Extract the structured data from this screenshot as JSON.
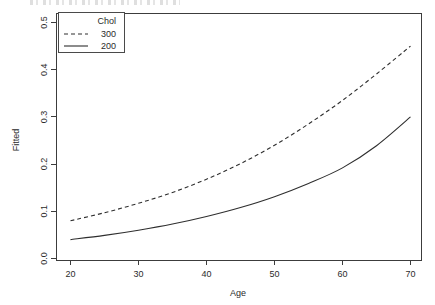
{
  "chart_data": {
    "type": "line",
    "title": "",
    "xlabel": "Age",
    "ylabel": "Fitted",
    "xlim": [
      20,
      70
    ],
    "ylim": [
      0.0,
      0.5
    ],
    "xticks": [
      20,
      30,
      40,
      50,
      60,
      70
    ],
    "xtick_labels": [
      "20",
      "30",
      "40",
      "50",
      "60",
      "70"
    ],
    "yticks": [
      0.0,
      0.1,
      0.2,
      0.3,
      0.4,
      0.5
    ],
    "ytick_labels": [
      "0.0",
      "0.1",
      "0.2",
      "0.3",
      "0.4",
      "0.5"
    ],
    "grid": false,
    "legend_title": "Chol",
    "legend_position": "top-left",
    "x": [
      20,
      25,
      30,
      35,
      40,
      45,
      50,
      55,
      60,
      65,
      70
    ],
    "series": [
      {
        "name": "300",
        "style": "dashed",
        "values": [
          0.08,
          0.097,
          0.117,
          0.14,
          0.168,
          0.201,
          0.24,
          0.285,
          0.335,
          0.391,
          0.45
        ]
      },
      {
        "name": "200",
        "style": "solid",
        "values": [
          0.04,
          0.049,
          0.06,
          0.073,
          0.089,
          0.108,
          0.131,
          0.159,
          0.192,
          0.239,
          0.3
        ]
      }
    ]
  },
  "legend": {
    "title": "Chol",
    "entries": [
      {
        "label": "300",
        "style": "dashed"
      },
      {
        "label": "200",
        "style": "solid"
      }
    ]
  },
  "axes": {
    "x_title": "Age",
    "y_title": "Fitted"
  },
  "colors": {
    "line": "#2e2e2e",
    "axis": "#3c3c3c",
    "text": "#2b2b2b",
    "background": "#ffffff"
  }
}
